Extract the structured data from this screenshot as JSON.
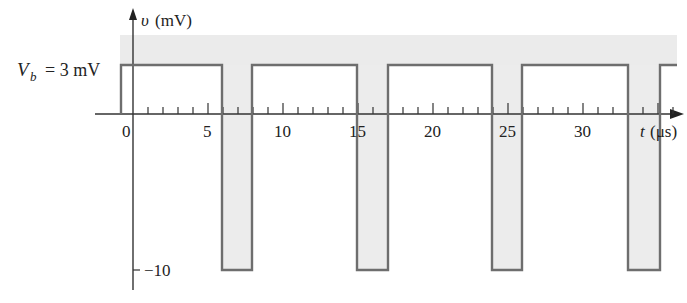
{
  "figure": {
    "y_axis_label": "v (mV)",
    "x_axis_label": "t (μs)",
    "vb_label": "V_b = 3 mV",
    "vb_text": "= 3 mV",
    "low_label": "−10",
    "x_ticks_labeled": [
      "0",
      "5",
      "10",
      "15",
      "20",
      "25",
      "30"
    ],
    "colors": {
      "waveform": "#6e6e6e",
      "axes": "#333333",
      "shade": "#e9e9e9",
      "pulse_fill": "#ececec"
    }
  },
  "chart_data": {
    "type": "line",
    "title": "",
    "xlabel": "t (μs)",
    "ylabel": "v (mV)",
    "high_level_mV": 3,
    "low_level_mV": -10,
    "pulse_width_us": 2,
    "period_us": 9,
    "low_intervals_us": [
      [
        6,
        8
      ],
      [
        15,
        17
      ],
      [
        24,
        26
      ],
      [
        33,
        35
      ]
    ],
    "x": [
      -1,
      6,
      6,
      8,
      8,
      15,
      15,
      17,
      17,
      24,
      24,
      26,
      26,
      33,
      33,
      35,
      35,
      36
    ],
    "y": [
      3,
      3,
      -10,
      -10,
      3,
      3,
      -10,
      -10,
      3,
      3,
      -10,
      -10,
      3,
      3,
      -10,
      -10,
      3,
      3
    ],
    "x_ticks": [
      0,
      5,
      10,
      15,
      20,
      25,
      30
    ],
    "y_ticks": [
      3,
      -10
    ],
    "grid": false
  }
}
